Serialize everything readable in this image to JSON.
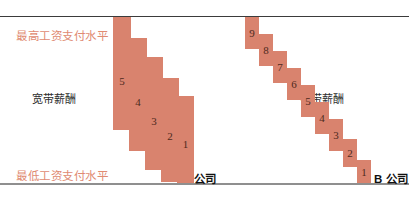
{
  "chart_data": {
    "type": "bar",
    "title": "",
    "xlabel": "",
    "ylabel": "",
    "grid": false,
    "legend_position": "inline-annotations",
    "axis_lines": {
      "top_label": "最高工资支付水平",
      "bottom_label": "最低工资支付水平"
    },
    "series": [
      {
        "name": "宽带薪酬",
        "company": "A 公司",
        "categories": [
          "5",
          "4",
          "3",
          "2",
          "1"
        ],
        "bands": [
          {
            "label": "5",
            "top_pct": 100,
            "bottom_pct": 36
          },
          {
            "label": "4",
            "top_pct": 85,
            "bottom_pct": 23
          },
          {
            "label": "3",
            "top_pct": 70,
            "bottom_pct": 12
          },
          {
            "label": "2",
            "top_pct": 55,
            "bottom_pct": 4
          },
          {
            "label": "1",
            "top_pct": 42,
            "bottom_pct": 0
          }
        ]
      },
      {
        "name": "窄带薪酬",
        "company": "B 公司",
        "categories": [
          "9",
          "8",
          "7",
          "6",
          "5",
          "4",
          "3",
          "2",
          "1"
        ],
        "bands": [
          {
            "label": "9",
            "top_pct": 100,
            "bottom_pct": 81
          },
          {
            "label": "8",
            "top_pct": 90,
            "bottom_pct": 71
          },
          {
            "label": "7",
            "top_pct": 80,
            "bottom_pct": 61
          },
          {
            "label": "6",
            "top_pct": 70,
            "bottom_pct": 51
          },
          {
            "label": "5",
            "top_pct": 60,
            "bottom_pct": 41
          },
          {
            "label": "4",
            "top_pct": 50,
            "bottom_pct": 31
          },
          {
            "label": "3",
            "top_pct": 40,
            "bottom_pct": 21
          },
          {
            "label": "2",
            "top_pct": 29,
            "bottom_pct": 11
          },
          {
            "label": "1",
            "top_pct": 18,
            "bottom_pct": 0
          }
        ]
      }
    ]
  },
  "labels": {
    "max_pay_level": "最高工资支付水平",
    "min_pay_level": "最低工资支付水平",
    "broadband_pay": "宽带薪酬",
    "narrowband_pay": "窄带薪酬",
    "company_a": "A 公司",
    "company_b": "B 公司"
  },
  "bands_a": [
    {
      "label": "5",
      "x": 113,
      "y": 17,
      "w": 18,
      "h": 113
    },
    {
      "label": "4",
      "x": 129,
      "y": 38,
      "w": 18,
      "h": 113
    },
    {
      "label": "3",
      "x": 145,
      "y": 57,
      "w": 18,
      "h": 113
    },
    {
      "label": "2",
      "x": 161,
      "y": 78,
      "w": 18,
      "h": 104
    },
    {
      "label": "1",
      "x": 177,
      "y": 96,
      "w": 17,
      "h": 87
    }
  ],
  "bands_b": [
    {
      "label": "9",
      "x": 245,
      "y": 17,
      "w": 14,
      "h": 32
    },
    {
      "label": "8",
      "x": 259,
      "y": 34,
      "w": 14,
      "h": 32
    },
    {
      "label": "7",
      "x": 273,
      "y": 51,
      "w": 14,
      "h": 32
    },
    {
      "label": "6",
      "x": 287,
      "y": 68,
      "w": 14,
      "h": 32
    },
    {
      "label": "5",
      "x": 301,
      "y": 85,
      "w": 14,
      "h": 32
    },
    {
      "label": "4",
      "x": 315,
      "y": 102,
      "w": 14,
      "h": 32
    },
    {
      "label": "3",
      "x": 329,
      "y": 119,
      "w": 14,
      "h": 32
    },
    {
      "label": "2",
      "x": 343,
      "y": 139,
      "w": 14,
      "h": 28
    },
    {
      "label": "1",
      "x": 357,
      "y": 160,
      "w": 14,
      "h": 23
    }
  ],
  "colors": {
    "band_fill": "#d9836e",
    "band_number": "#4e2a20",
    "cap_label": "#e08a72",
    "top_rule": "#3b3b3b",
    "bottom_rule": "#8f8f8f",
    "background": "#ffffff"
  }
}
